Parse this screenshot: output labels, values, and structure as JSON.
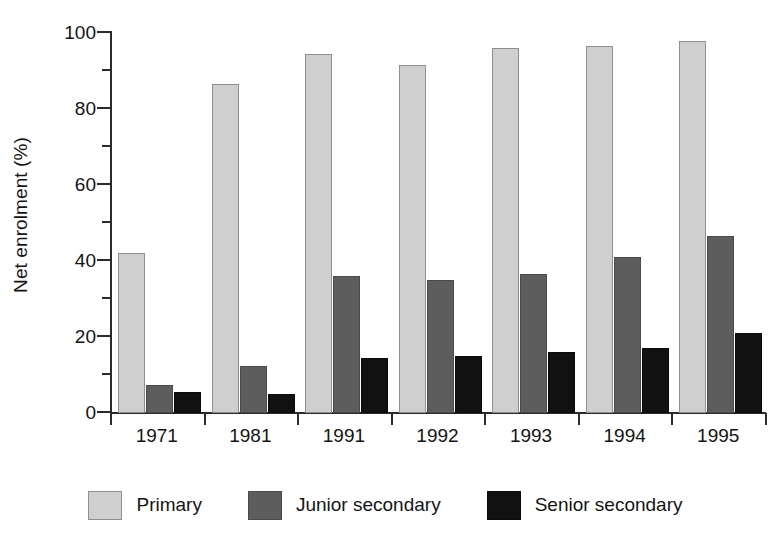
{
  "chart_data": {
    "type": "bar",
    "title": "",
    "subtitle": "",
    "xlabel": "",
    "ylabel": "Net enrolment (%)",
    "categories": [
      "1971",
      "1981",
      "1991",
      "1992",
      "1993",
      "1994",
      "1995"
    ],
    "series": [
      {
        "name": "Primary",
        "color": "#cfcfcf",
        "values": [
          42,
          86.5,
          94.5,
          91.5,
          96,
          96.5,
          98
        ]
      },
      {
        "name": "Junior secondary",
        "color": "#5d5d5d",
        "values": [
          7.5,
          12.5,
          36,
          35,
          36.5,
          41,
          46.5
        ]
      },
      {
        "name": "Senior secondary",
        "color": "#111111",
        "values": [
          5.5,
          5,
          14.5,
          15,
          16,
          17,
          21
        ]
      }
    ],
    "ylim": [
      0,
      100
    ],
    "y_major_ticks": [
      0,
      20,
      40,
      60,
      80,
      100
    ],
    "y_minor_ticks": [
      10,
      30,
      50,
      70,
      90
    ],
    "y_tick_labels": [
      "0",
      "20",
      "40",
      "60",
      "80",
      "100"
    ],
    "grid": false,
    "legend_position": "bottom",
    "bar_grouping": "grouped"
  },
  "axes": {
    "y_title": "Net enrolment (%)"
  },
  "legend": {
    "items": [
      {
        "label": "Primary",
        "swatch": "primary"
      },
      {
        "label": "Junior secondary",
        "swatch": "junior"
      },
      {
        "label": "Senior secondary",
        "swatch": "senior"
      }
    ]
  }
}
